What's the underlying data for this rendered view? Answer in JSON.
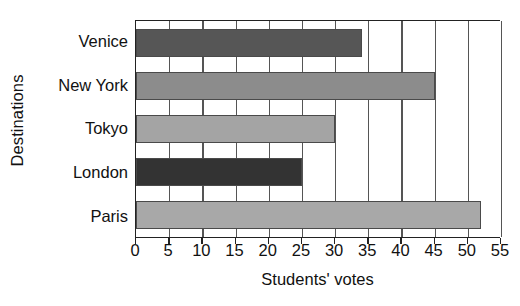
{
  "chart_data": {
    "type": "bar",
    "orientation": "horizontal",
    "title": "",
    "xlabel": "Students' votes",
    "ylabel": "Destinations",
    "categories": [
      "Venice",
      "New York",
      "Tokyo",
      "London",
      "Paris"
    ],
    "values": [
      34,
      45,
      30,
      25,
      52
    ],
    "bar_colors": [
      "#565656",
      "#8c8c8c",
      "#a4a4a4",
      "#333333",
      "#a8a8a8"
    ],
    "xlim": [
      0,
      55
    ],
    "xticks": [
      0,
      5,
      10,
      15,
      20,
      25,
      30,
      35,
      40,
      45,
      50,
      55
    ],
    "xtick_labels": [
      "0",
      "5",
      "10",
      "15",
      "20",
      "25",
      "30",
      "35",
      "40",
      "45",
      "50",
      "55"
    ],
    "grid": true,
    "grid_axis": "x",
    "legend": false,
    "series": [
      {
        "name": "Students' votes",
        "points": [
          {
            "category": "Venice",
            "value": 34,
            "color": "#565656"
          },
          {
            "category": "New York",
            "value": 45,
            "color": "#8c8c8c"
          },
          {
            "category": "Tokyo",
            "value": 30,
            "color": "#a4a4a4"
          },
          {
            "category": "London",
            "value": 25,
            "color": "#333333"
          },
          {
            "category": "Paris",
            "value": 52,
            "color": "#a8a8a8"
          }
        ]
      }
    ]
  }
}
